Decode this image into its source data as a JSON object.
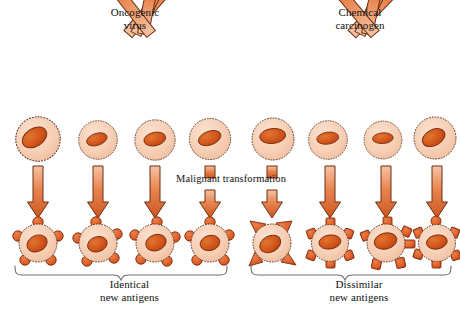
{
  "figure": {
    "title_alt": "Malignant transformation and tumor antigen diagram",
    "background": "#ffffff"
  },
  "labels": {
    "oncogenic_virus": "Oncogenic\nvirus",
    "chemical_carcinogen": "Chemical\ncarcinogen",
    "malignant_transformation": "Malignant transformation",
    "identical_new_antigens": "Identical\nnew antigens",
    "dissimilar_new_antigens": "Dissimilar\nnew antigens"
  },
  "colors": {
    "arrow_fill_light": "#f2a882",
    "arrow_fill_mid": "#e2743f",
    "arrow_fill_dark": "#c9511f",
    "arrow_outline": "#6b2f12",
    "cell_cytoplasm": "#f7ceb4",
    "cell_membrane": "#5c3a27",
    "nucleus_fill": "#d4561f",
    "nucleus_outline": "#7a2c0c",
    "antigen_fill": "#de5c27",
    "antigen_outline": "#7a2c0c",
    "brace_stroke": "#666666",
    "text": "#111111"
  },
  "diagram": {
    "left_group": {
      "inducer": "Oncogenic virus",
      "outcome": "Identical new antigens",
      "columns": 4,
      "normal_cells": [
        {
          "cx": 38,
          "cy": 139,
          "r": 22,
          "nucleus_rot": -32
        },
        {
          "cx": 98,
          "cy": 140,
          "r": 19,
          "nucleus_rot": -18
        },
        {
          "cx": 155,
          "cy": 140,
          "r": 20,
          "nucleus_rot": -12
        },
        {
          "cx": 210,
          "cy": 139,
          "r": 20,
          "nucleus_rot": -20
        }
      ],
      "transformed_cells": [
        {
          "cx": 38,
          "cy": 243,
          "r": 21,
          "antigen_shape": "round",
          "antigen_count": 6
        },
        {
          "cx": 98,
          "cy": 243,
          "r": 21,
          "antigen_shape": "round",
          "antigen_count": 6
        },
        {
          "cx": 155,
          "cy": 243,
          "r": 21,
          "antigen_shape": "round",
          "antigen_count": 6
        },
        {
          "cx": 210,
          "cy": 243,
          "r": 21,
          "antigen_shape": "round",
          "antigen_count": 6
        }
      ]
    },
    "right_group": {
      "inducer": "Chemical carcinogen",
      "outcome": "Dissimilar new antigens",
      "columns": 4,
      "normal_cells": [
        {
          "cx": 273,
          "cy": 139,
          "r": 21,
          "nucleus_rot": -6
        },
        {
          "cx": 328,
          "cy": 140,
          "r": 19,
          "nucleus_rot": -8
        },
        {
          "cx": 383,
          "cy": 140,
          "r": 19,
          "nucleus_rot": -4
        },
        {
          "cx": 435,
          "cy": 138,
          "r": 21,
          "nucleus_rot": -28
        }
      ],
      "transformed_cells": [
        {
          "cx": 272,
          "cy": 243,
          "r": 22,
          "antigen_shape": "triangle",
          "antigen_count": 4
        },
        {
          "cx": 330,
          "cy": 243,
          "r": 21,
          "antigen_shape": "square",
          "antigen_count": 6
        },
        {
          "cx": 386,
          "cy": 243,
          "r": 22,
          "antigen_shape": "mixed",
          "antigen_count": 6
        },
        {
          "cx": 437,
          "cy": 243,
          "r": 21,
          "antigen_shape": "square",
          "antigen_count": 6
        }
      ]
    },
    "diagonal_arrows": [
      {
        "group": "left",
        "x1": 128,
        "y1": 34,
        "x2": 40,
        "y2": 112
      },
      {
        "group": "left",
        "x1": 136,
        "y1": 34,
        "x2": 96,
        "y2": 113
      },
      {
        "group": "left",
        "x1": 143,
        "y1": 34,
        "x2": 156,
        "y2": 113
      },
      {
        "group": "left",
        "x1": 151,
        "y1": 34,
        "x2": 212,
        "y2": 112
      },
      {
        "group": "right",
        "x1": 352,
        "y1": 34,
        "x2": 272,
        "y2": 112
      },
      {
        "group": "right",
        "x1": 360,
        "y1": 34,
        "x2": 327,
        "y2": 113
      },
      {
        "group": "right",
        "x1": 367,
        "y1": 34,
        "x2": 384,
        "y2": 113
      },
      {
        "group": "right",
        "x1": 375,
        "y1": 34,
        "x2": 436,
        "y2": 112
      }
    ],
    "vertical_arrows": [
      {
        "group": "left",
        "x": 38,
        "y1": 165,
        "y2": 219,
        "length": "long"
      },
      {
        "group": "left",
        "x": 98,
        "y1": 165,
        "y2": 219,
        "length": "long"
      },
      {
        "group": "left",
        "x": 155,
        "y1": 165,
        "y2": 219,
        "length": "long"
      },
      {
        "group": "left",
        "x": 210,
        "y1": 165,
        "y2": 219,
        "length": "short"
      },
      {
        "group": "right",
        "x": 272,
        "y1": 165,
        "y2": 219,
        "length": "short"
      },
      {
        "group": "right",
        "x": 330,
        "y1": 165,
        "y2": 219,
        "length": "long"
      },
      {
        "group": "right",
        "x": 386,
        "y1": 165,
        "y2": 219,
        "length": "long"
      },
      {
        "group": "right",
        "x": 437,
        "y1": 165,
        "y2": 219,
        "length": "long"
      }
    ],
    "braces": [
      {
        "group": "left",
        "x1": 14,
        "x2": 228,
        "y": 272,
        "label": "Identical new antigens"
      },
      {
        "group": "right",
        "x1": 250,
        "x2": 452,
        "y": 272,
        "label": "Dissimilar new antigens"
      }
    ]
  }
}
